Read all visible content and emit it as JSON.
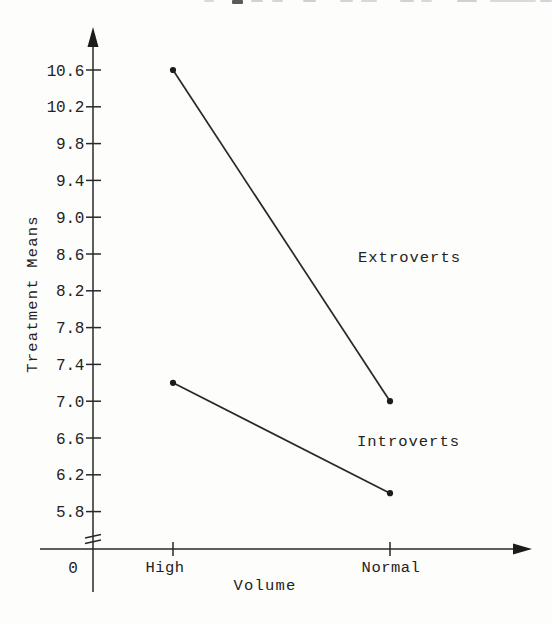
{
  "page": {
    "background": "#fdfdfb",
    "ink": "#232323"
  },
  "chart_data": {
    "type": "line",
    "title": "",
    "xlabel": "Volume",
    "ylabel": "Treatment Means",
    "x_origin_label": "0",
    "categories": [
      "High",
      "Normal"
    ],
    "series": [
      {
        "name": "Extroverts",
        "values": [
          10.6,
          7.0
        ]
      },
      {
        "name": "Introverts",
        "values": [
          7.2,
          6.0
        ]
      }
    ],
    "yticks": [
      10.6,
      10.2,
      9.8,
      9.4,
      9.0,
      8.6,
      8.2,
      7.8,
      7.4,
      7.0,
      6.6,
      6.2,
      5.8
    ],
    "ylim": [
      5.4,
      11.0
    ],
    "xlim_categories_px_hint": "High left-of-center, Normal right",
    "axis_break_above_origin": true,
    "grid": false,
    "legend_position": "inline-labels",
    "marker": "filled-circle"
  }
}
